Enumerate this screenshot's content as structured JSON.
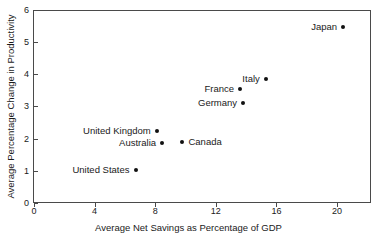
{
  "chart_data": {
    "type": "scatter",
    "title": "",
    "xlabel": "Average Net Savings as Percentage of GDP",
    "ylabel": "Average Percentage Change in Productivity",
    "xlim": [
      0,
      22.3
    ],
    "ylim": [
      0,
      6
    ],
    "xticks": [
      "0",
      "4",
      "8",
      "12",
      "16",
      "20"
    ],
    "xtick_values": [
      0,
      4,
      8,
      12,
      16,
      20
    ],
    "yticks": [
      "0",
      "1",
      "2",
      "3",
      "4",
      "5",
      "6"
    ],
    "ytick_values": [
      0,
      1,
      2,
      3,
      4,
      5,
      6
    ],
    "grid": false,
    "legend": "none",
    "points": [
      {
        "label": "Japan",
        "x": 20.4,
        "y": 5.47,
        "label_side": "left"
      },
      {
        "label": "Italy",
        "x": 15.3,
        "y": 3.85,
        "label_side": "left"
      },
      {
        "label": "France",
        "x": 13.6,
        "y": 3.54,
        "label_side": "left"
      },
      {
        "label": "Germany",
        "x": 13.8,
        "y": 3.1,
        "label_side": "left"
      },
      {
        "label": "United Kingdom",
        "x": 8.1,
        "y": 2.24,
        "label_side": "left"
      },
      {
        "label": "Australia",
        "x": 8.45,
        "y": 1.86,
        "label_side": "left"
      },
      {
        "label": "Canada",
        "x": 9.8,
        "y": 1.9,
        "label_side": "right"
      },
      {
        "label": "United States",
        "x": 6.7,
        "y": 1.02,
        "label_side": "left"
      }
    ]
  }
}
